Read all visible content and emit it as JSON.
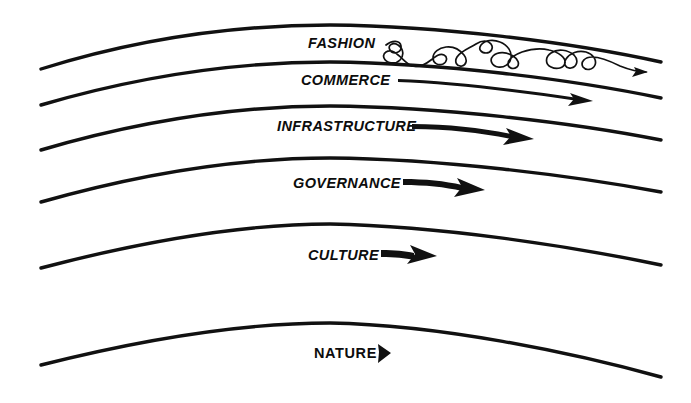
{
  "diagram": {
    "type": "layered-curve-diagram",
    "background_color": "#ffffff",
    "stroke_color": "#111111",
    "layer_count": 6,
    "layers": [
      {
        "id": "fashion",
        "label": "FASHION",
        "order": 1,
        "speed_rank": "fastest",
        "label_style": "italic-bold",
        "arrow_style": "squiggle",
        "arrow_description": "long erratic looping squiggle ending in small thin arrowhead",
        "label_x": 308,
        "label_y": 48,
        "curve_left": {
          "x": 41,
          "y": 69
        },
        "curve_apex": {
          "x": 322,
          "y": 25
        },
        "curve_right": {
          "x": 661,
          "y": 62
        }
      },
      {
        "id": "commerce",
        "label": "COMMERCE",
        "order": 2,
        "speed_rank": "fast",
        "label_style": "italic-bold",
        "arrow_style": "thin-long",
        "arrow_description": "long thin tapering arrow",
        "label_x": 301,
        "label_y": 85,
        "curve_left": {
          "x": 41,
          "y": 105
        },
        "curve_apex": {
          "x": 322,
          "y": 62
        },
        "curve_right": {
          "x": 661,
          "y": 98
        }
      },
      {
        "id": "infrastructure",
        "label": "INFRASTRUCTURE",
        "order": 3,
        "speed_rank": "medium",
        "label_style": "italic-bold",
        "arrow_style": "thick-medium",
        "arrow_description": "medium thick tapered arrow",
        "label_x": 277,
        "label_y": 131,
        "curve_left": {
          "x": 41,
          "y": 150
        },
        "curve_apex": {
          "x": 322,
          "y": 106
        },
        "curve_right": {
          "x": 661,
          "y": 140
        }
      },
      {
        "id": "governance",
        "label": "GOVERNANCE",
        "order": 4,
        "speed_rank": "slow",
        "label_style": "italic-bold",
        "arrow_style": "thick-short",
        "arrow_description": "short thick arrow",
        "label_x": 293,
        "label_y": 188,
        "curve_left": {
          "x": 41,
          "y": 202
        },
        "curve_apex": {
          "x": 322,
          "y": 158
        },
        "curve_right": {
          "x": 661,
          "y": 192
        }
      },
      {
        "id": "culture",
        "label": "CULTURE",
        "order": 5,
        "speed_rank": "slower",
        "label_style": "italic-bold",
        "arrow_style": "thick-stubby",
        "arrow_description": "stubby thick arrow",
        "label_x": 308,
        "label_y": 260,
        "curve_left": {
          "x": 41,
          "y": 268
        },
        "curve_apex": {
          "x": 322,
          "y": 224
        },
        "curve_right": {
          "x": 661,
          "y": 265
        }
      },
      {
        "id": "nature",
        "label": "NATURE",
        "order": 6,
        "speed_rank": "slowest",
        "label_style": "upright-bold",
        "arrow_style": "arrowhead-only",
        "arrow_description": "small solid triangular arrowhead only",
        "label_x": 314,
        "label_y": 358,
        "curve_left": {
          "x": 41,
          "y": 365
        },
        "curve_apex": {
          "x": 322,
          "y": 323
        },
        "curve_right": {
          "x": 661,
          "y": 377
        }
      }
    ]
  }
}
